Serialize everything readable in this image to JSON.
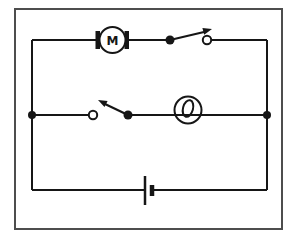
{
  "figure": {
    "kind": "electric-circuit-diagram",
    "colors": {
      "ink": "#161616",
      "frame": "#4d4d4d",
      "bg": "#ffffff"
    },
    "components": {
      "motor": {
        "name": "motor",
        "label": "M"
      },
      "top_switch": {
        "name": "switch",
        "state": "open"
      },
      "middle_switch": {
        "name": "switch",
        "state": "open"
      },
      "lamp": {
        "name": "filament-lamp"
      },
      "battery": {
        "name": "cell"
      }
    }
  }
}
